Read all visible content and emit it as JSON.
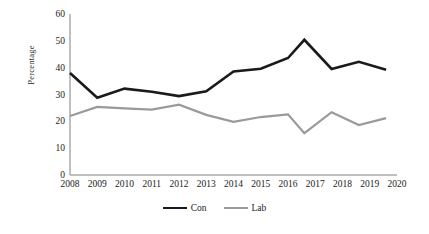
{
  "chart_data": {
    "type": "line",
    "title": "",
    "xlabel": "",
    "ylabel": "Percentage",
    "x": [
      2008,
      2009,
      2010,
      2011,
      2012,
      2013,
      2014,
      2015,
      2016,
      2017,
      2018,
      2019,
      2020
    ],
    "xtick_labels": [
      "2008",
      "2009",
      "2010",
      "2011",
      "2012",
      "2013",
      "2014",
      "2015",
      "2016",
      "2017",
      "2018",
      "2019",
      "2020"
    ],
    "ytick_labels": [
      "0",
      "10",
      "20",
      "30",
      "40",
      "50",
      "60"
    ],
    "ytick_values": [
      0,
      10,
      20,
      30,
      40,
      50,
      60
    ],
    "ylim": [
      0,
      60
    ],
    "xlim": [
      2008,
      2020
    ],
    "grid": false,
    "legend_position": "bottom",
    "series": [
      {
        "name": "Con",
        "color": "#1a1a1a",
        "width": 2.6,
        "points": [
          {
            "x": 2008.0,
            "y": 38.0
          },
          {
            "x": 2009.0,
            "y": 28.8
          },
          {
            "x": 2010.0,
            "y": 32.2
          },
          {
            "x": 2011.0,
            "y": 31.0
          },
          {
            "x": 2012.0,
            "y": 29.4
          },
          {
            "x": 2013.0,
            "y": 31.2
          },
          {
            "x": 2014.0,
            "y": 38.6
          },
          {
            "x": 2015.0,
            "y": 39.6
          },
          {
            "x": 2016.0,
            "y": 43.6
          },
          {
            "x": 2016.6,
            "y": 50.4
          },
          {
            "x": 2017.6,
            "y": 39.5
          },
          {
            "x": 2018.6,
            "y": 42.2
          },
          {
            "x": 2019.6,
            "y": 39.2
          }
        ]
      },
      {
        "name": "Lab",
        "color": "#9a9a9a",
        "width": 2.2,
        "points": [
          {
            "x": 2008.0,
            "y": 22.0
          },
          {
            "x": 2009.0,
            "y": 25.4
          },
          {
            "x": 2010.0,
            "y": 24.8
          },
          {
            "x": 2011.0,
            "y": 24.4
          },
          {
            "x": 2012.0,
            "y": 26.2
          },
          {
            "x": 2013.0,
            "y": 22.4
          },
          {
            "x": 2014.0,
            "y": 19.8
          },
          {
            "x": 2015.0,
            "y": 21.6
          },
          {
            "x": 2016.0,
            "y": 22.6
          },
          {
            "x": 2016.6,
            "y": 15.6
          },
          {
            "x": 2017.6,
            "y": 23.4
          },
          {
            "x": 2018.6,
            "y": 18.6
          },
          {
            "x": 2019.6,
            "y": 21.2
          }
        ]
      }
    ],
    "legend": [
      {
        "label": "Con",
        "color": "#1a1a1a"
      },
      {
        "label": "Lab",
        "color": "#9a9a9a"
      }
    ]
  },
  "axes": {
    "axis_color": "#808080",
    "plot_left_px": 70,
    "plot_right_px": 397,
    "plot_top_px": 14,
    "plot_bottom_px": 175
  }
}
